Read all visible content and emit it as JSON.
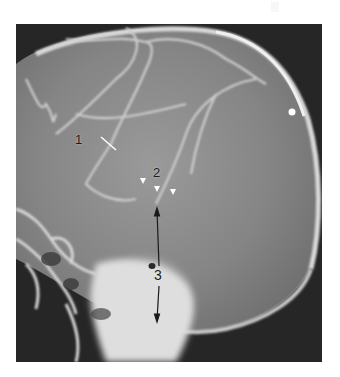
{
  "figure": {
    "type": "lateral skull radiograph (angiogram)",
    "background_color": "#ffffff",
    "image_background_color": "#262626",
    "bone_color": "#e8e8e8",
    "vessel_color": "#d4d4d4"
  },
  "annotations": {
    "label_1": {
      "text": "1",
      "marker": "white pointer line"
    },
    "label_2": {
      "text": "2",
      "marker": "three white arrowheads"
    },
    "label_3": {
      "text": "3",
      "marker": "double-headed black arrow"
    }
  }
}
